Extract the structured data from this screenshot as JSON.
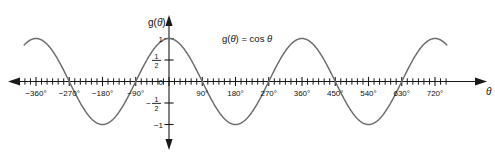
{
  "chart_data": {
    "type": "line",
    "title": "",
    "function_label": "g(θ) = cos θ",
    "xlabel": "θ",
    "ylabel": "g(θ)",
    "xlim": [
      -390,
      750
    ],
    "ylim": [
      -1.35,
      1.35
    ],
    "grid": false,
    "legend": "none",
    "x_major_step": 90,
    "x_minor_step": 15,
    "y_major_ticks": [
      1,
      0.5,
      0,
      -0.5,
      -1
    ],
    "x_tick_labels": [
      {
        "value": -360,
        "text": "−360°"
      },
      {
        "value": -270,
        "text": "−270°"
      },
      {
        "value": -180,
        "text": "−180°"
      },
      {
        "value": -90,
        "text": "−90°"
      },
      {
        "value": 90,
        "text": "90°"
      },
      {
        "value": 180,
        "text": "180°"
      },
      {
        "value": 270,
        "text": "270°"
      },
      {
        "value": 360,
        "text": "360°"
      },
      {
        "value": 450,
        "text": "450°"
      },
      {
        "value": 540,
        "text": "540°"
      },
      {
        "value": 630,
        "text": "630°"
      },
      {
        "value": 720,
        "text": "720°"
      }
    ],
    "y_tick_labels": [
      {
        "value": 1,
        "text": "1"
      },
      {
        "value": 0.5,
        "text": "½",
        "numerator": "1",
        "denominator": "2"
      },
      {
        "value": 0,
        "text": "0"
      },
      {
        "value": -0.5,
        "text": "−½",
        "numerator": "1",
        "denominator": "2",
        "sign": "−"
      },
      {
        "value": -1,
        "text": "−1"
      }
    ],
    "series": [
      {
        "name": "g(θ) = cos θ",
        "expression": "cos",
        "amplitude": 1,
        "period_degrees": 360,
        "phase_degrees": 0,
        "color": "#6e6e6e",
        "key_points": [
          {
            "x": -360,
            "y": 1
          },
          {
            "x": -270,
            "y": 0
          },
          {
            "x": -180,
            "y": -1
          },
          {
            "x": -90,
            "y": 0
          },
          {
            "x": 0,
            "y": 1
          },
          {
            "x": 90,
            "y": 0
          },
          {
            "x": 180,
            "y": -1
          },
          {
            "x": 270,
            "y": 0
          },
          {
            "x": 360,
            "y": 1
          },
          {
            "x": 450,
            "y": 0
          },
          {
            "x": 540,
            "y": -1
          },
          {
            "x": 630,
            "y": 0
          },
          {
            "x": 720,
            "y": 1
          }
        ]
      }
    ],
    "colors": {
      "curve": "#6e6e6e",
      "axis": "#1a1a1a",
      "text": "#111111",
      "background": "#ffffff"
    }
  }
}
